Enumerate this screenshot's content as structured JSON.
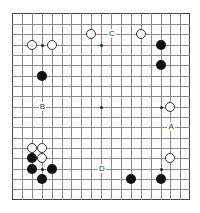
{
  "board": {
    "size": 19,
    "origin_px": [
      12,
      13.5
    ],
    "spacing_px": [
      9.9,
      10.35
    ],
    "line_color": "#8a8a8a",
    "star_points": [
      [
        3,
        3
      ],
      [
        9,
        3
      ],
      [
        15,
        3
      ],
      [
        3,
        9
      ],
      [
        9,
        9
      ],
      [
        15,
        9
      ],
      [
        3,
        15
      ],
      [
        9,
        15
      ],
      [
        15,
        15
      ]
    ],
    "stones": [
      {
        "color": "white",
        "col": 2,
        "row": 3
      },
      {
        "color": "white",
        "col": 4,
        "row": 3
      },
      {
        "color": "white",
        "col": 8,
        "row": 2
      },
      {
        "color": "white",
        "col": 13,
        "row": 2
      },
      {
        "color": "black",
        "col": 15,
        "row": 3
      },
      {
        "color": "black",
        "col": 15,
        "row": 5
      },
      {
        "color": "black",
        "col": 3,
        "row": 6
      },
      {
        "color": "white",
        "col": 16,
        "row": 9
      },
      {
        "color": "white",
        "col": 2,
        "row": 13
      },
      {
        "color": "white",
        "col": 3,
        "row": 13
      },
      {
        "color": "black",
        "col": 2,
        "row": 14
      },
      {
        "color": "white",
        "col": 3,
        "row": 14
      },
      {
        "color": "black",
        "col": 2,
        "row": 15
      },
      {
        "color": "black",
        "col": 4,
        "row": 15
      },
      {
        "color": "black",
        "col": 3,
        "row": 16
      },
      {
        "color": "white",
        "col": 16,
        "row": 14
      },
      {
        "color": "black",
        "col": 12,
        "row": 16
      },
      {
        "color": "black",
        "col": 15,
        "row": 16
      }
    ],
    "labels": [
      {
        "text": "C",
        "col": 10,
        "row": 2
      },
      {
        "text": "B",
        "col": 3,
        "row": 9
      },
      {
        "text": "A",
        "col": 16,
        "row": 11
      },
      {
        "text": "D",
        "col": 9,
        "row": 15
      }
    ]
  }
}
